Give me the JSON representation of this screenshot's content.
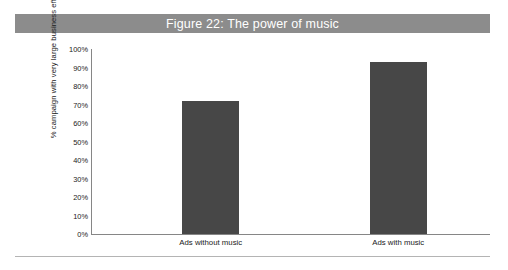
{
  "figure": {
    "title": "Figure 22: The power of music",
    "banner_color": "#8c8c8c",
    "banner_text_color": "#ffffff"
  },
  "chart_data": {
    "type": "bar",
    "title": "Figure 22: The power of music",
    "xlabel": "",
    "ylabel": "% campaign with very large business effects",
    "categories": [
      "Ads without music",
      "Ads with music"
    ],
    "values": [
      72,
      93
    ],
    "ylim": [
      0,
      100
    ],
    "ytick_labels": [
      "100%",
      "90%",
      "80%",
      "70%",
      "60%",
      "50%",
      "40%",
      "30%",
      "20%",
      "10%",
      "0%"
    ],
    "ytick_values": [
      100,
      90,
      80,
      70,
      60,
      50,
      40,
      30,
      20,
      10,
      0
    ],
    "grid": false,
    "legend": false,
    "bar_color": "#474747",
    "axis_color": "#868686"
  }
}
